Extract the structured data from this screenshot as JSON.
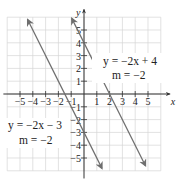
{
  "chart_data": {
    "type": "line",
    "title": "",
    "xlabel": "x",
    "ylabel": "y",
    "xlim": [
      -6,
      6
    ],
    "ylim": [
      -6,
      6
    ],
    "grid": true,
    "x_ticks": [
      -5,
      -4,
      -3,
      -2,
      -1,
      1,
      2,
      3,
      4,
      5
    ],
    "y_ticks": [
      -5,
      -4,
      -3,
      -2,
      -1,
      1,
      2,
      3,
      4,
      5
    ],
    "x_tick_labels": [
      "−5",
      "−4",
      "−3",
      "−2",
      "−1",
      "1",
      "2",
      "3",
      "4",
      "5"
    ],
    "y_tick_labels": [
      "−5",
      "−4",
      "−3",
      "−2",
      "−1",
      "1",
      "2",
      "3",
      "4",
      "5"
    ],
    "series": [
      {
        "name": "y = −2x + 4",
        "slope": -2,
        "intercept": 4,
        "x": [
          -0.95,
          4.8
        ],
        "y": [
          5.9,
          -5.6
        ],
        "annotation": {
          "equation": "y = −2x + 4",
          "slope_label": "m = −2"
        }
      },
      {
        "name": "y = −2x − 3",
        "slope": -2,
        "intercept": -3,
        "x": [
          -4.4,
          1.4
        ],
        "y": [
          5.8,
          -5.8
        ],
        "annotation": {
          "equation": "y = −2x − 3",
          "slope_label": "m = −2"
        }
      }
    ]
  },
  "colors": {
    "grid": "#d6d6d6",
    "axis": "#333333",
    "line": "#6e6e6e"
  }
}
